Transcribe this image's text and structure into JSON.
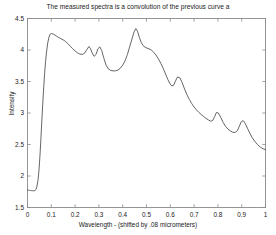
{
  "chart_data": {
    "type": "line",
    "title": "The measured spectra is a convolution of the previous curve a",
    "xlabel": "Wavelength - (shifted by .08 micrometers)",
    "ylabel": "Intensity",
    "xlim": [
      0,
      1
    ],
    "ylim": [
      1.5,
      4.5
    ],
    "xticks": [
      0,
      0.1,
      0.2,
      0.3,
      0.4,
      0.5,
      0.6,
      0.7,
      0.8,
      0.9,
      1
    ],
    "xticklabels": [
      "0",
      "0.1",
      "0.2",
      "0.3",
      "0.4",
      "0.5",
      "0.6",
      "0.7",
      "0.8",
      "0.9",
      "1"
    ],
    "yticks": [
      1.5,
      2,
      2.5,
      3,
      3.5,
      4,
      4.5
    ],
    "yticklabels": [
      "1.5",
      "2",
      "2.5",
      "3",
      "3.5",
      "4",
      "4.5"
    ],
    "grid": false,
    "legend": null,
    "line_color": "#4a4a4a",
    "series": [
      {
        "name": "measured spectra",
        "x": [
          0.0,
          0.004,
          0.008,
          0.012,
          0.016,
          0.02,
          0.024,
          0.028,
          0.032,
          0.036,
          0.04,
          0.044,
          0.048,
          0.052,
          0.056,
          0.06,
          0.064,
          0.068,
          0.072,
          0.076,
          0.08,
          0.085,
          0.09,
          0.095,
          0.1,
          0.11,
          0.12,
          0.13,
          0.14,
          0.15,
          0.16,
          0.17,
          0.18,
          0.19,
          0.2,
          0.21,
          0.22,
          0.23,
          0.24,
          0.25,
          0.258,
          0.265,
          0.272,
          0.28,
          0.288,
          0.296,
          0.304,
          0.312,
          0.32,
          0.33,
          0.34,
          0.35,
          0.36,
          0.37,
          0.38,
          0.39,
          0.4,
          0.41,
          0.42,
          0.43,
          0.44,
          0.448,
          0.455,
          0.462,
          0.47,
          0.478,
          0.486,
          0.494,
          0.502,
          0.51,
          0.52,
          0.53,
          0.54,
          0.55,
          0.56,
          0.57,
          0.58,
          0.59,
          0.598,
          0.606,
          0.614,
          0.622,
          0.63,
          0.64,
          0.65,
          0.66,
          0.67,
          0.68,
          0.69,
          0.7,
          0.71,
          0.72,
          0.73,
          0.74,
          0.75,
          0.76,
          0.77,
          0.778,
          0.786,
          0.794,
          0.802,
          0.812,
          0.822,
          0.832,
          0.842,
          0.852,
          0.862,
          0.872,
          0.882,
          0.89,
          0.898,
          0.906,
          0.914,
          0.924,
          0.934,
          0.944,
          0.954,
          0.966,
          0.978,
          0.99,
          1.0
        ],
        "y": [
          1.78,
          1.776,
          1.772,
          1.77,
          1.768,
          1.766,
          1.765,
          1.766,
          1.77,
          1.79,
          1.84,
          1.93,
          2.08,
          2.3,
          2.57,
          2.86,
          3.14,
          3.4,
          3.63,
          3.82,
          3.97,
          4.11,
          4.2,
          4.25,
          4.262,
          4.25,
          4.225,
          4.2,
          4.18,
          4.16,
          4.135,
          4.1,
          4.06,
          4.02,
          3.985,
          3.955,
          3.935,
          3.93,
          3.95,
          4.01,
          4.055,
          4.02,
          3.95,
          3.9,
          3.93,
          4.02,
          4.05,
          3.99,
          3.88,
          3.76,
          3.7,
          3.675,
          3.668,
          3.67,
          3.68,
          3.71,
          3.76,
          3.83,
          3.93,
          4.06,
          4.19,
          4.29,
          4.34,
          4.3,
          4.2,
          4.12,
          4.07,
          4.045,
          4.03,
          4.02,
          4.0,
          3.965,
          3.92,
          3.86,
          3.79,
          3.71,
          3.62,
          3.53,
          3.47,
          3.43,
          3.44,
          3.51,
          3.57,
          3.56,
          3.48,
          3.38,
          3.29,
          3.215,
          3.15,
          3.095,
          3.05,
          3.01,
          2.975,
          2.945,
          2.915,
          2.89,
          2.87,
          2.88,
          2.94,
          3.01,
          3.0,
          2.93,
          2.85,
          2.79,
          2.745,
          2.715,
          2.695,
          2.69,
          2.72,
          2.79,
          2.86,
          2.88,
          2.84,
          2.76,
          2.68,
          2.61,
          2.555,
          2.5,
          2.46,
          2.43,
          2.42
        ]
      }
    ]
  }
}
